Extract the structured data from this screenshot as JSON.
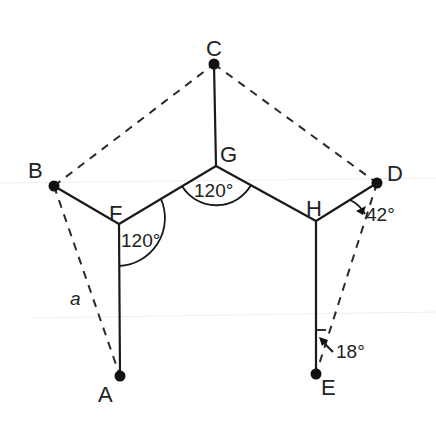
{
  "diagram": {
    "points": {
      "A": {
        "label": "A",
        "x": 120,
        "y": 376
      },
      "B": {
        "label": "B",
        "x": 54,
        "y": 186
      },
      "C": {
        "label": "C",
        "x": 214,
        "y": 64
      },
      "D": {
        "label": "D",
        "x": 377,
        "y": 183
      },
      "E": {
        "label": "E",
        "x": 316,
        "y": 374
      },
      "F": {
        "label": "F",
        "x": 119,
        "y": 224
      },
      "G": {
        "label": "G",
        "x": 216,
        "y": 166
      },
      "H": {
        "label": "H",
        "x": 316,
        "y": 221
      }
    },
    "solid_segments": [
      "B-F",
      "F-G",
      "G-H",
      "H-D",
      "F-A",
      "G-C",
      "H-E"
    ],
    "dashed_segments": [
      "B-C",
      "C-D",
      "B-A",
      "D-E"
    ],
    "side_labels": {
      "a": "a"
    },
    "angles": {
      "F": "120°",
      "G": "120°",
      "D": "42°",
      "E": "18°"
    }
  }
}
